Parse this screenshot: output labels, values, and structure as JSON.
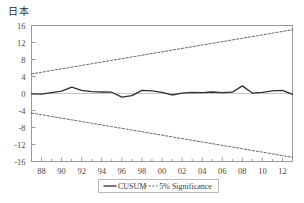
{
  "chart_data": {
    "type": "line",
    "title": "日本",
    "xlabel": "",
    "ylabel": "",
    "xlim": [
      1987,
      2013
    ],
    "ylim": [
      -16,
      16
    ],
    "grid": false,
    "legend_position": "bottom-center",
    "y_ticks": [
      16,
      12,
      8,
      4,
      0,
      -4,
      -8,
      -12,
      -16
    ],
    "y_tick_labels": [
      "16",
      "12",
      "8",
      "4",
      "0",
      "-4",
      "-8",
      "-12",
      "-16"
    ],
    "x_ticks": [
      1988,
      1990,
      1992,
      1994,
      1996,
      1998,
      2000,
      2002,
      2004,
      2006,
      2008,
      2010,
      2012
    ],
    "x_tick_labels": [
      "88",
      "90",
      "92",
      "94",
      "96",
      "98",
      "00",
      "02",
      "04",
      "06",
      "08",
      "10",
      "12"
    ],
    "x": [
      1987,
      1988,
      1989,
      1990,
      1991,
      1992,
      1993,
      1994,
      1995,
      1996,
      1997,
      1998,
      1999,
      2000,
      2001,
      2002,
      2003,
      2004,
      2005,
      2006,
      2007,
      2008,
      2009,
      2010,
      2011,
      2012,
      2013
    ],
    "series": [
      {
        "name": "CUSUM",
        "style": "solid",
        "color": "#2e2e2e",
        "values": [
          -0.1,
          -0.15,
          0.2,
          0.55,
          1.5,
          0.75,
          0.45,
          0.35,
          0.3,
          -0.85,
          -0.5,
          0.75,
          0.6,
          0.25,
          -0.35,
          0.1,
          0.25,
          0.2,
          0.35,
          0.2,
          0.3,
          1.8,
          0.1,
          0.25,
          0.6,
          0.75,
          -0.2
        ]
      },
      {
        "name": "5% Significance",
        "style": "dashed",
        "color": "#555555",
        "values": [
          4.6,
          5.0,
          5.4,
          5.8,
          6.2,
          6.6,
          7.0,
          7.4,
          7.8,
          8.2,
          8.6,
          9.0,
          9.4,
          9.8,
          10.2,
          10.6,
          11.0,
          11.4,
          11.8,
          12.2,
          12.6,
          13.0,
          13.4,
          13.8,
          14.2,
          14.6,
          15.0
        ]
      },
      {
        "name": "5% Significance Lower",
        "style": "dashed",
        "color": "#555555",
        "values": [
          -4.6,
          -5.0,
          -5.4,
          -5.8,
          -6.2,
          -6.6,
          -7.0,
          -7.4,
          -7.8,
          -8.2,
          -8.6,
          -9.0,
          -9.4,
          -9.8,
          -10.2,
          -10.6,
          -11.0,
          -11.4,
          -11.8,
          -12.2,
          -12.6,
          -13.0,
          -13.4,
          -13.8,
          -14.2,
          -14.6,
          -15.0
        ]
      }
    ],
    "legend": [
      {
        "label": "CUSUM",
        "style": "solid",
        "color": "#2e2e2e"
      },
      {
        "label": "5% Significance",
        "style": "dashed",
        "color": "#555555"
      }
    ]
  }
}
